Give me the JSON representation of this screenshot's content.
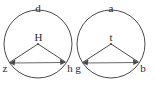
{
  "figure": {
    "background_color": "#ffffff",
    "stroke_color": "#4a4a4a",
    "chord_color": "#6a6a6a",
    "label_color": "#2b2b2b",
    "shapes": [
      {
        "id": "left-circle",
        "center_label": "H",
        "arc_label": "d",
        "left_point_label": "z",
        "right_point_label": "h",
        "cx": 38,
        "cy": 44,
        "r": 34
      },
      {
        "id": "right-circle",
        "center_label": "t",
        "arc_label": "a",
        "left_point_label": "g",
        "right_point_label": "b",
        "cx": 111,
        "cy": 44,
        "r": 34
      }
    ],
    "labels": {
      "left_arc": "d",
      "left_center": "H",
      "left_point_a": "z",
      "left_point_b": "h",
      "right_arc": "a",
      "right_center": "t",
      "right_point_a": "g",
      "right_point_b": "b"
    }
  }
}
